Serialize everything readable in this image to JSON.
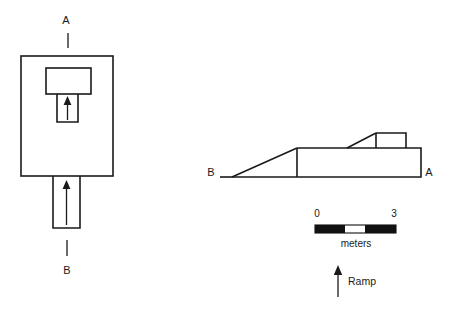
{
  "figure": {
    "background_color": "#ffffff",
    "line_color": "#1a1a1a"
  },
  "plan_view": {
    "name": "plan-view",
    "section_line_top": {
      "label": "A",
      "label_x": 66,
      "label_y": 21,
      "tick_x": 68,
      "tick_y1": 33,
      "tick_y2": 48
    },
    "section_line_bottom": {
      "label": "B",
      "label_x": 67,
      "label_y": 271,
      "tick_x": 67,
      "tick_y1": 240,
      "tick_y2": 256
    },
    "outer_rect": {
      "x": 21,
      "y": 56,
      "w": 92,
      "h": 120
    },
    "inner_chamber": {
      "x": 46,
      "y": 68,
      "w": 45,
      "h": 26
    },
    "inner_passage": {
      "x": 57,
      "y": 94,
      "w": 21,
      "h": 28
    },
    "inner_arrow": {
      "x": 67.5,
      "y_tail": 120,
      "y_head": 99
    },
    "lower_corridor": {
      "x": 53,
      "y": 176,
      "w": 27,
      "h": 52
    },
    "lower_arrow": {
      "x": 66.5,
      "y_tail": 225,
      "y_head": 182
    }
  },
  "elevation_view": {
    "name": "elevation-view",
    "label_left": {
      "text": "B",
      "x": 211,
      "y": 173
    },
    "label_right": {
      "text": "A",
      "x": 429,
      "y": 173
    },
    "baseline": {
      "x1": 220,
      "y": 177,
      "x2": 421
    },
    "ramp_slope": {
      "x1": 232,
      "y1": 177,
      "x2": 297,
      "y2": 148
    },
    "platform": {
      "x": 297,
      "y": 148,
      "w": 124,
      "h": 29
    },
    "upper_ramp": {
      "x1": 347,
      "y1": 148,
      "x2": 376,
      "y2": 133
    },
    "upper_block": {
      "x": 376,
      "y": 133,
      "w": 30,
      "h": 15
    }
  },
  "scale_bar": {
    "name": "scale-bar",
    "label_start": "0",
    "label_end": "3",
    "unit_label": "meters",
    "start_x": 315,
    "end_x": 396,
    "bar_y": 225,
    "bar_h": 8,
    "label_y": 214,
    "unit_y": 244,
    "segments": [
      {
        "from": 315,
        "to": 345,
        "fill": "black"
      },
      {
        "from": 345,
        "to": 365,
        "fill": "white"
      },
      {
        "from": 365,
        "to": 372,
        "fill": "black"
      },
      {
        "from": 372,
        "to": 396,
        "fill": "black"
      }
    ]
  },
  "ramp_annotation": {
    "name": "ramp-annotation",
    "label": "Ramp",
    "label_x": 350,
    "label_y": 282,
    "arrow_x": 338,
    "arrow_y_tail": 297,
    "arrow_y_head": 267
  }
}
